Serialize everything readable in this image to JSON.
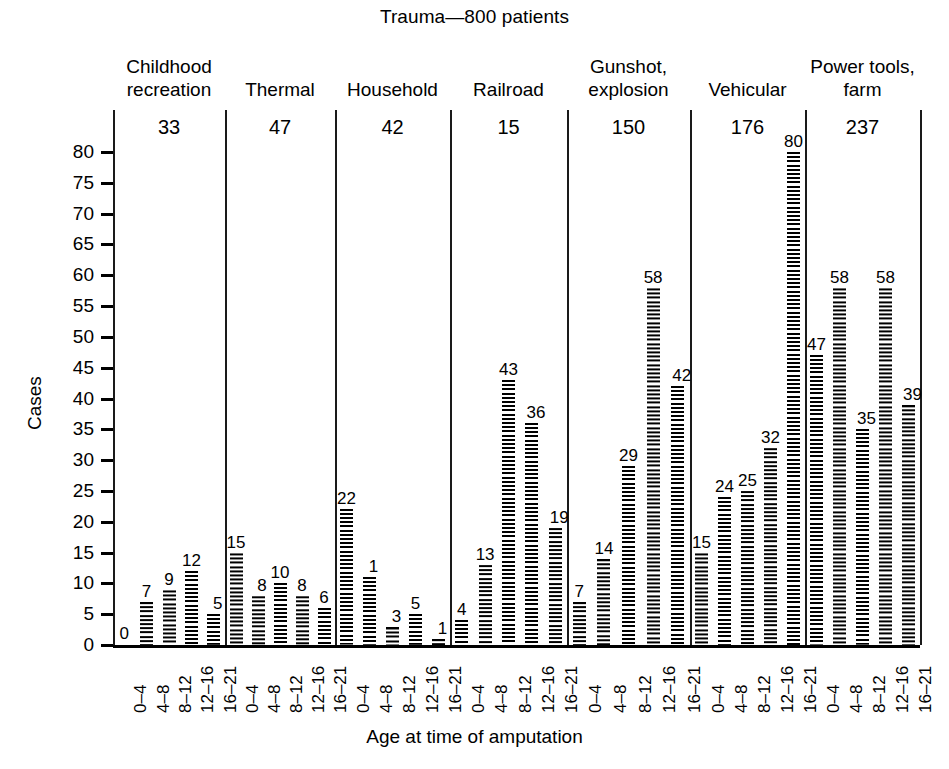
{
  "chart_data": {
    "type": "bar",
    "title": "Trauma—800 patients",
    "xlabel": "Age at time of amputation",
    "ylabel": "Cases",
    "ylim": [
      0,
      82
    ],
    "yticks": [
      0,
      5,
      10,
      15,
      20,
      25,
      30,
      35,
      40,
      45,
      50,
      55,
      60,
      65,
      70,
      75,
      80
    ],
    "grid": false,
    "legend": "none",
    "categories": [
      "0–4",
      "4–8",
      "8–12",
      "12–16",
      "16–21"
    ],
    "groups": [
      {
        "name_line1": "Childhood",
        "name_line2": "recreation",
        "total": "33",
        "values": [
          0,
          7,
          9,
          12,
          5
        ],
        "labels": [
          "0",
          "7",
          "9",
          "12",
          "5"
        ]
      },
      {
        "name_line1": "Thermal",
        "name_line2": "",
        "total": "47",
        "values": [
          15,
          8,
          10,
          8,
          6
        ],
        "labels": [
          "15",
          "8",
          "10",
          "8",
          "6"
        ]
      },
      {
        "name_line1": "Household",
        "name_line2": "",
        "total": "42",
        "values": [
          22,
          11,
          3,
          5,
          1
        ],
        "labels": [
          "22",
          "1",
          "3",
          "5",
          "1"
        ]
      },
      {
        "name_line1": "Railroad",
        "name_line2": "",
        "total": "15",
        "values": [
          4,
          13,
          43,
          36,
          19
        ],
        "labels": [
          "4",
          "13",
          "43",
          "36",
          "19"
        ]
      },
      {
        "name_line1": "Gunshot,",
        "name_line2": "explosion",
        "total": "150",
        "values": [
          7,
          14,
          29,
          58,
          42
        ],
        "labels": [
          "7",
          "14",
          "29",
          "58",
          "42"
        ]
      },
      {
        "name_line1": "Vehicular",
        "name_line2": "",
        "total": "176",
        "values": [
          15,
          24,
          25,
          32,
          80
        ],
        "labels": [
          "15",
          "24",
          "25",
          "32",
          "80"
        ]
      },
      {
        "name_line1": "Power tools,",
        "name_line2": "farm",
        "total": "237",
        "values": [
          47,
          58,
          35,
          58,
          39
        ],
        "labels": [
          "47",
          "58",
          "35",
          "58",
          "39"
        ]
      }
    ]
  },
  "colors": {
    "ink": "#000000",
    "background": "#ffffff"
  }
}
